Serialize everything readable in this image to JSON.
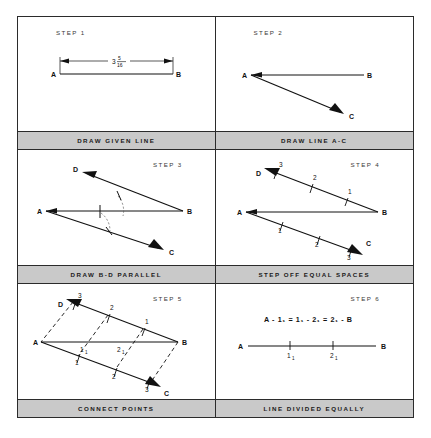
{
  "sheet": {
    "title": "Dividing a line into equal parts — six step drafting procedure",
    "frame_color": "#2b2b2b",
    "caption_bar_color": "#c9c9c9",
    "line_color": "#111111",
    "background": "#ffffff"
  },
  "panels": [
    {
      "id": "step1",
      "step_label": "STEP 1",
      "caption": "DRAW GIVEN LINE",
      "points": [
        "A",
        "B"
      ],
      "dimension": {
        "whole": "3",
        "numerator": "5",
        "denominator": "16"
      },
      "ticks": []
    },
    {
      "id": "step2",
      "step_label": "STEP 2",
      "caption": "DRAW LINE A-C",
      "points": [
        "A",
        "B",
        "C"
      ],
      "ticks": []
    },
    {
      "id": "step3",
      "step_label": "STEP 3",
      "caption": "DRAW B-D PARALLEL",
      "points": [
        "A",
        "B",
        "C",
        "D"
      ],
      "ticks": []
    },
    {
      "id": "step4",
      "step_label": "STEP 4",
      "caption": "STEP OFF EQUAL SPACES",
      "points": [
        "A",
        "B",
        "C",
        "D"
      ],
      "ticks_upper": [
        "3",
        "2",
        "1"
      ],
      "ticks_lower": [
        "1",
        "2",
        "3"
      ]
    },
    {
      "id": "step5",
      "step_label": "STEP 5",
      "caption": "CONNECT POINTS",
      "points": [
        "A",
        "B",
        "C",
        "D"
      ],
      "ticks_upper": [
        "3",
        "2",
        "1"
      ],
      "ticks_lower": [
        "1",
        "2",
        "3"
      ],
      "intersections": [
        {
          "base": "1",
          "sub": "1"
        },
        {
          "base": "2",
          "sub": "1"
        }
      ]
    },
    {
      "id": "step6",
      "step_label": "STEP 6",
      "caption": "LINE DIVIDED EQUALLY",
      "points": [
        "A",
        "B"
      ],
      "equation": "A - 1₁ = 1₁ - 2₁ = 2₁ - B",
      "marks": [
        {
          "base": "1",
          "sub": "1"
        },
        {
          "base": "2",
          "sub": "1"
        }
      ]
    }
  ]
}
